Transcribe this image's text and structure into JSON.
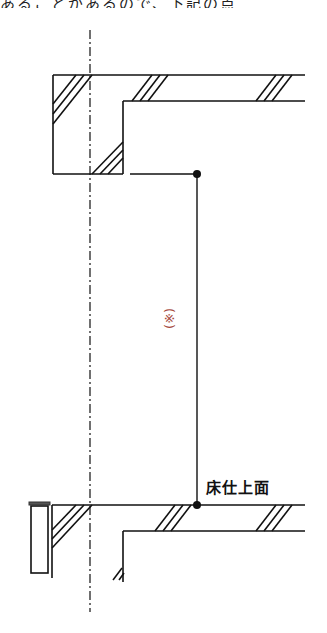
{
  "header": {
    "cropped_text": "あることがあるので、下記の点"
  },
  "diagram": {
    "type": "architectural-section",
    "labels": {
      "floor_finish": "床仕上面",
      "note_marker": "(※)"
    },
    "colors": {
      "line": "#111111",
      "note": "#a5473c",
      "cap": "#555555"
    }
  }
}
